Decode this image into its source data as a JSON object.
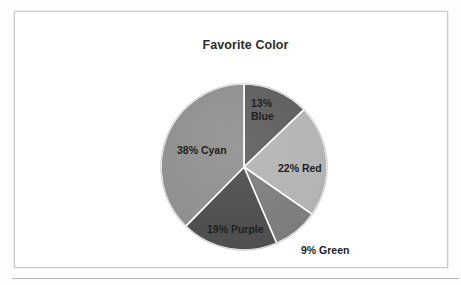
{
  "page": {
    "background_color": "#fdfdfd",
    "frame_border_color": "#c9c9c9",
    "bottom_rule_color": "#b9b9b9"
  },
  "chart_data": {
    "type": "pie",
    "title": "Favorite Color",
    "xlabel": "",
    "ylabel": "",
    "start_angle_deg": 0,
    "direction": "clockwise",
    "legend": "none",
    "labels_mode": "inside-slice-with-percent",
    "categories": [
      "Blue",
      "Red",
      "Green",
      "Purple",
      "Cyan"
    ],
    "values": [
      13,
      22,
      9,
      19,
      38
    ],
    "slices": [
      {
        "name": "Blue",
        "percent": 13,
        "label": "13%\nBlue",
        "label_line1": "13%",
        "label_line2": "Blue",
        "fill": "#5c5c5c",
        "label_position": "inside"
      },
      {
        "name": "Red",
        "percent": 22,
        "label": "22% Red",
        "fill": "#b3b3b3",
        "label_position": "inside"
      },
      {
        "name": "Green",
        "percent": 9,
        "label": "9% Green",
        "fill": "#7b7b7b",
        "label_position": "outside"
      },
      {
        "name": "Purple",
        "percent": 19,
        "label": "19% Purple",
        "fill": "#4b4b4b",
        "label_position": "inside"
      },
      {
        "name": "Cyan",
        "percent": 38,
        "label": "38% Cyan",
        "fill": "#8e8e8e",
        "label_position": "inside"
      }
    ],
    "separator_color": "#ffffff",
    "total_percent": 100
  }
}
